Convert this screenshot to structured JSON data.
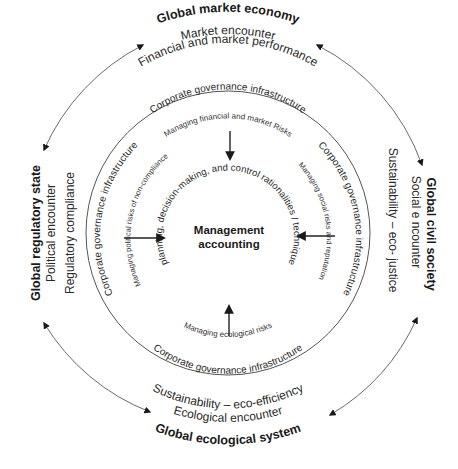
{
  "outer": {
    "top": {
      "title": "Global market economy",
      "encounter": "Market encounter",
      "concern": "Financial and market performance"
    },
    "left": {
      "title": "Global regulatory state",
      "encounter": "Political encounter",
      "concern": "Regulatory compliance"
    },
    "right": {
      "title": "Global civil society",
      "encounter": "Social e ncounter",
      "concern": "Sustainability – eco- justice"
    },
    "bottom": {
      "title": "Global ecological system",
      "encounter": "Ecological encounter",
      "concern": "Sustainability – eco-efficiency"
    }
  },
  "inner": {
    "top": {
      "infrastructure": "Corporate governance infrastructure",
      "risk": "Managing financial and market Risks"
    },
    "left": {
      "infrastructure": "Corporate governance infrastructure",
      "risk": "Managing political risks of non-compliance"
    },
    "right": {
      "infrastructure": "Corporate governance infrastructure",
      "risk": "Managing social risks and reputation"
    },
    "bottom": {
      "infrastructure": "Corporate governance infrastructure",
      "risk": "Managing ecological risks"
    }
  },
  "center": {
    "line1": "Management",
    "line2": "accounting",
    "rationalities": "planning, decision-making, and control rationalities / technique"
  },
  "colors": {
    "text": "#1a1a1a",
    "lines": "#6a6a6a",
    "arrows": "#222222",
    "background": "#ffffff"
  }
}
